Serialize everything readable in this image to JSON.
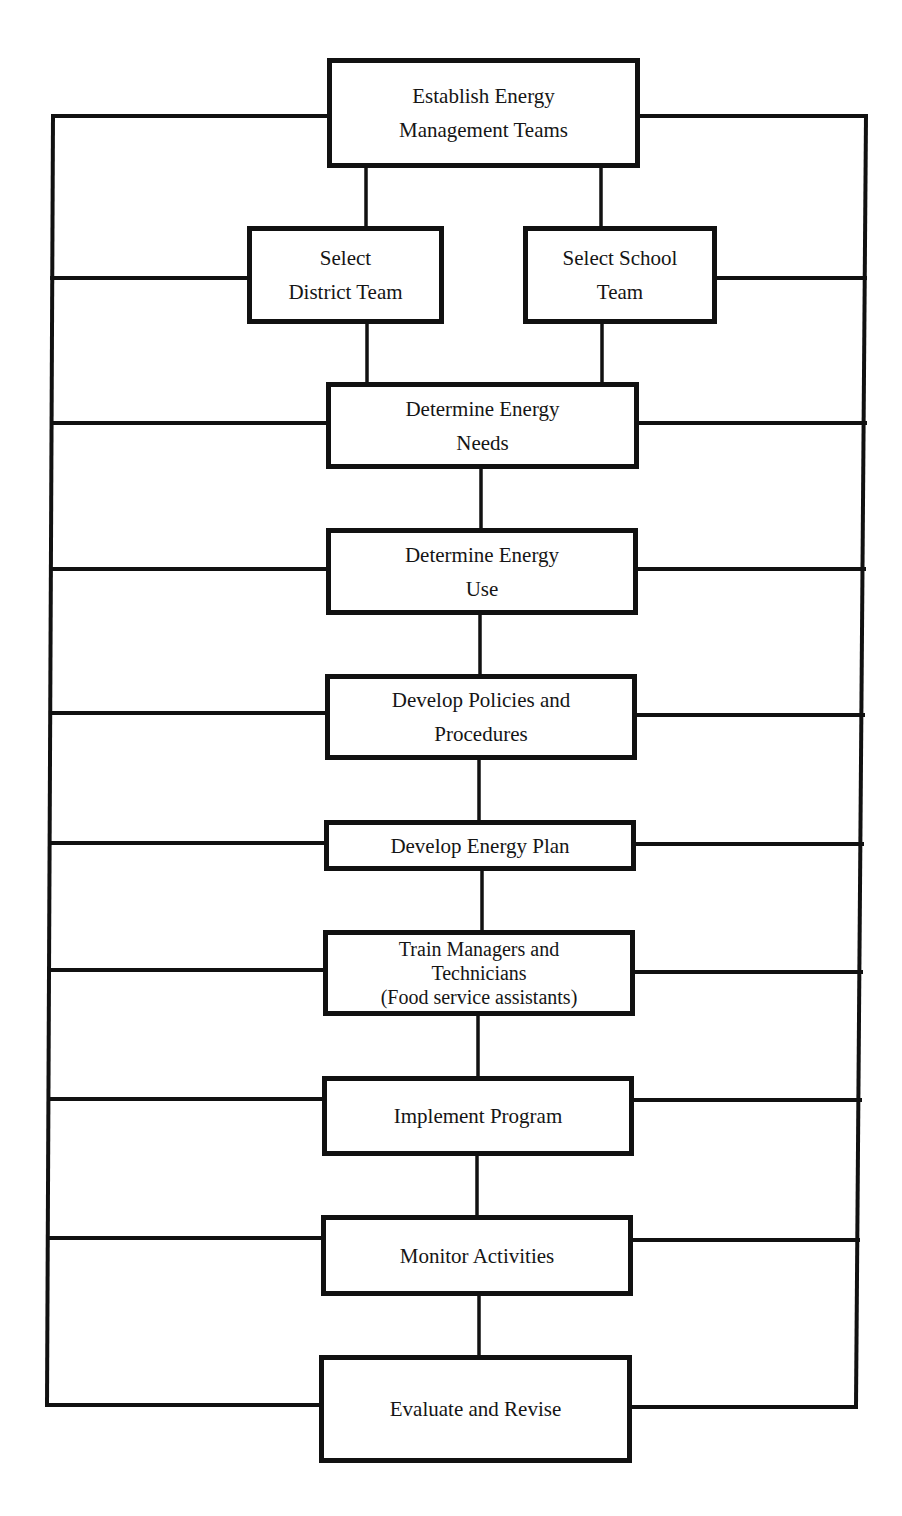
{
  "diagram": {
    "type": "flowchart",
    "colors": {
      "line": "#111111",
      "text": "#151515",
      "background": "#ffffff"
    },
    "nodes": {
      "establish": {
        "line1": "Establish Energy",
        "line2": "Management Teams"
      },
      "district": {
        "line1": "Select",
        "line2": "District Team"
      },
      "school": {
        "line1": "Select School",
        "line2": "Team"
      },
      "needs": {
        "line1": "Determine Energy",
        "line2": "Needs"
      },
      "use": {
        "line1": "Determine Energy",
        "line2": "Use"
      },
      "policies": {
        "line1": "Develop Policies and",
        "line2": "Procedures"
      },
      "plan": {
        "line1": "Develop Energy Plan"
      },
      "train": {
        "line1": "Train Managers and",
        "line2": "Technicians",
        "line3": "(Food service assistants)"
      },
      "implement": {
        "line1": "Implement Program"
      },
      "monitor": {
        "line1": "Monitor Activities"
      },
      "evaluate": {
        "line1": "Evaluate and Revise"
      }
    },
    "edges": [
      [
        "establish",
        "district"
      ],
      [
        "establish",
        "school"
      ],
      [
        "district",
        "needs"
      ],
      [
        "school",
        "needs"
      ],
      [
        "needs",
        "use"
      ],
      [
        "use",
        "policies"
      ],
      [
        "policies",
        "plan"
      ],
      [
        "plan",
        "train"
      ],
      [
        "train",
        "implement"
      ],
      [
        "implement",
        "monitor"
      ],
      [
        "monitor",
        "evaluate"
      ]
    ],
    "feedback_rails": [
      "left",
      "right"
    ]
  }
}
